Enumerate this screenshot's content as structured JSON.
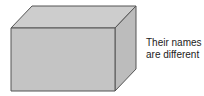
{
  "diagram": {
    "shape": "rectangular-box",
    "label_lines": [
      "Their names",
      "are different"
    ],
    "colors": {
      "front": "#c4c4c4",
      "top": "#cdcdcd",
      "side": "#bcbcbc",
      "edge": "#555555",
      "text": "#222222"
    }
  }
}
